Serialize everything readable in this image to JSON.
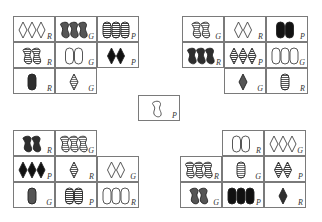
{
  "game": "Set-style card puzzle",
  "colors": {
    "R": "#2e2e2e",
    "G": "#555555",
    "P": "#111111",
    "stroke": "#222222"
  },
  "blocks": {
    "top_left": [
      {
        "count": 3,
        "shape": "diamond",
        "fill": "open",
        "color": "R"
      },
      {
        "count": 3,
        "shape": "squiggle",
        "fill": "solid",
        "color": "G"
      },
      {
        "count": 3,
        "shape": "oval",
        "fill": "striped",
        "color": "P"
      },
      {
        "count": 2,
        "shape": "squiggle",
        "fill": "striped",
        "color": "R"
      },
      {
        "count": 2,
        "shape": "oval",
        "fill": "open",
        "color": "G"
      },
      {
        "count": 2,
        "shape": "diamond",
        "fill": "solid",
        "color": "P"
      },
      {
        "count": 1,
        "shape": "oval",
        "fill": "solid",
        "color": "R"
      },
      {
        "count": 1,
        "shape": "diamond",
        "fill": "striped",
        "color": "G"
      },
      null
    ],
    "top_right": [
      {
        "count": 2,
        "shape": "squiggle",
        "fill": "striped",
        "color": "G"
      },
      {
        "count": 2,
        "shape": "diamond",
        "fill": "open",
        "color": "R"
      },
      {
        "count": 2,
        "shape": "oval",
        "fill": "solid",
        "color": "P"
      },
      {
        "count": 3,
        "shape": "squiggle",
        "fill": "solid",
        "color": "R"
      },
      {
        "count": 3,
        "shape": "diamond",
        "fill": "striped",
        "color": "P"
      },
      {
        "count": 3,
        "shape": "oval",
        "fill": "open",
        "color": "G"
      },
      null,
      {
        "count": 1,
        "shape": "diamond",
        "fill": "solid",
        "color": "G"
      },
      {
        "count": 1,
        "shape": "oval",
        "fill": "striped",
        "color": "R"
      }
    ],
    "center": [
      {
        "count": 1,
        "shape": "squiggle",
        "fill": "open",
        "color": "P"
      }
    ],
    "bottom_left": [
      {
        "count": 2,
        "shape": "squiggle",
        "fill": "solid",
        "color": "R"
      },
      {
        "count": 3,
        "shape": "squiggle",
        "fill": "striped",
        "color": "G"
      },
      null,
      {
        "count": 3,
        "shape": "diamond",
        "fill": "solid",
        "color": "P"
      },
      {
        "count": 1,
        "shape": "diamond",
        "fill": "striped",
        "color": "R"
      },
      {
        "count": 2,
        "shape": "diamond",
        "fill": "open",
        "color": "G"
      },
      {
        "count": 1,
        "shape": "oval",
        "fill": "solid",
        "color": "G"
      },
      {
        "count": 2,
        "shape": "oval",
        "fill": "striped",
        "color": "P"
      },
      {
        "count": 3,
        "shape": "oval",
        "fill": "open",
        "color": "R"
      }
    ],
    "bottom_right": [
      null,
      {
        "count": 2,
        "shape": "oval",
        "fill": "open",
        "color": "R"
      },
      {
        "count": 3,
        "shape": "diamond",
        "fill": "open",
        "color": "G"
      },
      {
        "count": 3,
        "shape": "squiggle",
        "fill": "striped",
        "color": "R"
      },
      {
        "count": 1,
        "shape": "oval",
        "fill": "striped",
        "color": "G"
      },
      {
        "count": 2,
        "shape": "diamond",
        "fill": "striped",
        "color": "P"
      },
      {
        "count": 2,
        "shape": "squiggle",
        "fill": "solid",
        "color": "G"
      },
      {
        "count": 3,
        "shape": "oval",
        "fill": "solid",
        "color": "P"
      },
      {
        "count": 1,
        "shape": "diamond",
        "fill": "solid",
        "color": "R"
      }
    ]
  }
}
